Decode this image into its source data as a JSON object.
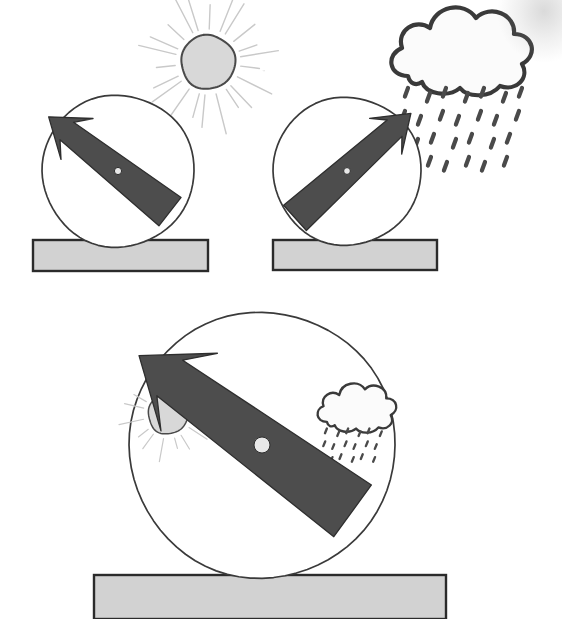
{
  "figure": {
    "type": "line-art-diagram",
    "background_color": "#ffffff",
    "width": 562,
    "height": 619,
    "ink_color": "#3a3a3a",
    "needle_color": "#4d4d4d",
    "needle_outline": "#2e2e2e",
    "pedestal_fill": "#d2d2d2",
    "pedestal_stroke": "#2b2b2b",
    "sun_fill": "#d8d8d8",
    "sun_stroke": "#4a4a4a",
    "ray_color": "#c9c9c9",
    "cloud_fill": "#fbfbfb",
    "cloud_stroke": "#3a3a3a",
    "rain_color": "#4a4a4a",
    "pivot_fill": "#e8e8e8"
  },
  "panels": [
    {
      "id": "panel-top-left",
      "label": "Barometer pointing up-left toward fair weather",
      "dial": {
        "cx": 118,
        "cy": 171,
        "r": 76
      },
      "needle": {
        "angle_deg": 218,
        "direction": "up-left",
        "length": 88,
        "tail_length": 66,
        "half_width": 11,
        "head_half_width": 26,
        "head_length": 36,
        "barb_inset": 13,
        "pivot_r": 3.6,
        "tail_half_width": 18
      },
      "pedestal": {
        "x": 33,
        "y": 240,
        "w": 175,
        "h": 31
      },
      "symbols": [
        {
          "kind": "sun",
          "cx": 208,
          "cy": 62,
          "r": 27,
          "ray_count": 22,
          "ray_inner": 33,
          "ray_outer": 72,
          "ray_width": 1.4,
          "scale": 1
        }
      ]
    },
    {
      "id": "panel-top-right",
      "label": "Barometer pointing up-right toward rain",
      "dial": {
        "cx": 347,
        "cy": 171,
        "r": 74
      },
      "needle": {
        "angle_deg": 318,
        "direction": "up-right",
        "length": 86,
        "tail_length": 70,
        "half_width": 11,
        "head_half_width": 24,
        "head_length": 34,
        "barb_inset": 12,
        "pivot_r": 3.4,
        "tail_half_width": 17
      },
      "pedestal": {
        "x": 273,
        "y": 240,
        "w": 164,
        "h": 30
      },
      "symbols": [
        {
          "kind": "rain-cloud",
          "cx": 460,
          "cy": 62,
          "scale": 1,
          "rain_rows": 4,
          "rain_cols": 7,
          "rain_angle_deg": 20
        }
      ]
    },
    {
      "id": "panel-bottom",
      "label": "Large barometer with sun on the left and rain cloud on the right",
      "dial": {
        "cx": 262,
        "cy": 445,
        "r": 133
      },
      "needle": {
        "angle_deg": 216,
        "direction": "up-left",
        "length": 152,
        "tail_length": 112,
        "half_width": 22,
        "head_half_width": 48,
        "head_length": 62,
        "barb_inset": 24,
        "pivot_r": 8,
        "tail_half_width": 32
      },
      "pedestal": {
        "x": 94,
        "y": 575,
        "w": 352,
        "h": 44,
        "clipped_bottom": true
      },
      "symbols": [
        {
          "kind": "sun",
          "cx": 168,
          "cy": 414,
          "r": 20,
          "ray_count": 16,
          "ray_inner": 25,
          "ray_outer": 47,
          "ray_width": 1.2,
          "scale": 0.74
        },
        {
          "kind": "rain-cloud",
          "cx": 356,
          "cy": 414,
          "scale": 0.56,
          "rain_rows": 3,
          "rain_cols": 6,
          "rain_angle_deg": 22
        }
      ]
    }
  ],
  "artifacts": [
    {
      "id": "scan-smudge-top-right",
      "description": "faint grey scanner smudge in the upper-right corner",
      "x": 498,
      "y": 0,
      "w": 64,
      "h": 62,
      "opacity": 0.5
    },
    {
      "id": "scan-speck-left",
      "description": "small grey speck near the left margin",
      "x": 262,
      "y": 70,
      "w": 3,
      "h": 2,
      "opacity": 0.35
    }
  ]
}
